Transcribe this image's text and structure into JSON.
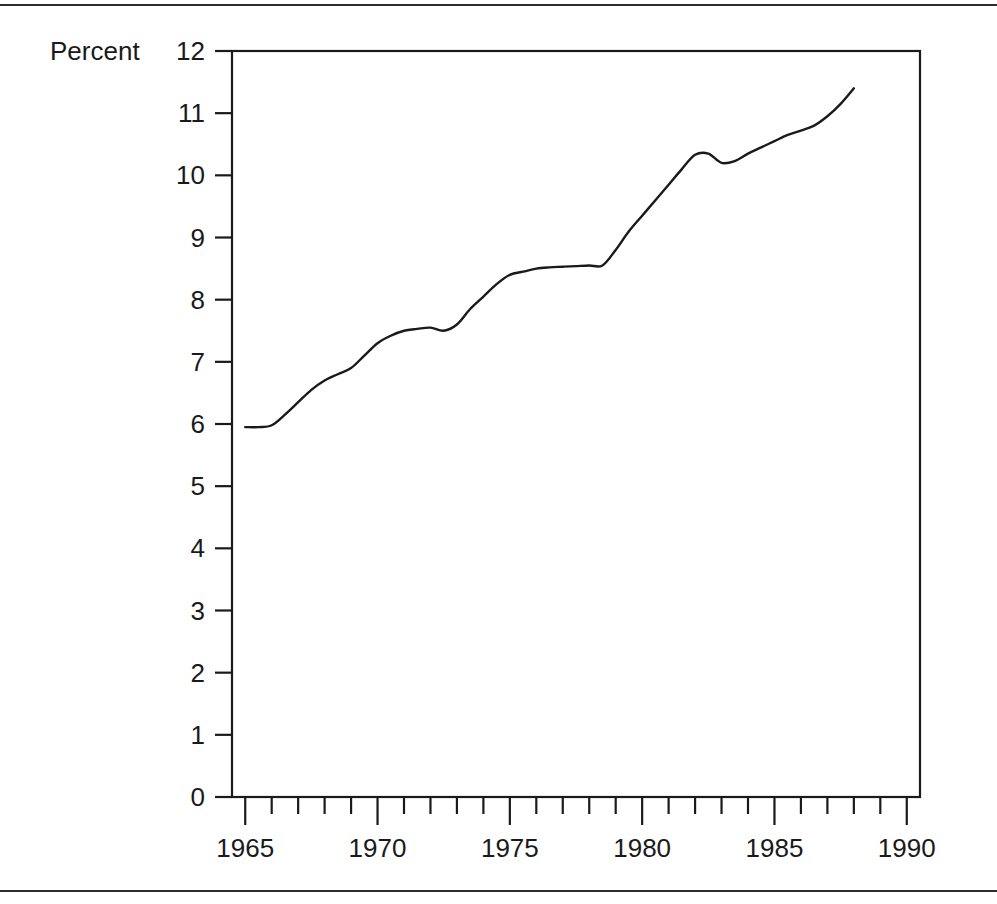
{
  "figure": {
    "ylabel": "Percent",
    "top_rule": true,
    "bottom_rule": true
  },
  "chart_data": {
    "type": "line",
    "title": "",
    "subtitle": "",
    "xlabel": "",
    "ylabel": "Percent",
    "xlim": [
      1964.5,
      1990.5
    ],
    "ylim": [
      0,
      12
    ],
    "grid": false,
    "legend": false,
    "legend_position": "none",
    "x_tick_labels": [
      "1965",
      "1970",
      "1975",
      "1980",
      "1985",
      "1990"
    ],
    "x_major_ticks": [
      1965,
      1970,
      1975,
      1980,
      1985,
      1990
    ],
    "x_minor_ticks": [
      1966,
      1967,
      1968,
      1969,
      1971,
      1972,
      1973,
      1974,
      1976,
      1977,
      1978,
      1979,
      1981,
      1982,
      1983,
      1984,
      1986,
      1987,
      1988,
      1989
    ],
    "y_tick_labels": [
      "0",
      "1",
      "2",
      "3",
      "4",
      "5",
      "6",
      "7",
      "8",
      "9",
      "10",
      "11",
      "12"
    ],
    "y_ticks": [
      0,
      1,
      2,
      3,
      4,
      5,
      6,
      7,
      8,
      9,
      10,
      11,
      12
    ],
    "line_color": "#1a1a1a",
    "series": [
      {
        "name": "Percent",
        "x": [
          1965,
          1965.5,
          1966,
          1966.5,
          1967,
          1967.5,
          1968,
          1968.5,
          1969,
          1969.5,
          1970,
          1970.5,
          1971,
          1971.5,
          1972,
          1972.5,
          1973,
          1973.5,
          1974,
          1974.5,
          1975,
          1975.5,
          1976,
          1976.5,
          1977,
          1977.5,
          1978,
          1978.5,
          1979,
          1979.5,
          1980,
          1980.5,
          1981,
          1981.5,
          1982,
          1982.5,
          1983,
          1983.5,
          1984,
          1984.5,
          1985,
          1985.5,
          1986,
          1986.5,
          1987,
          1987.5,
          1988
        ],
        "y": [
          5.95,
          5.95,
          5.98,
          6.15,
          6.35,
          6.55,
          6.7,
          6.8,
          6.9,
          7.1,
          7.3,
          7.42,
          7.5,
          7.53,
          7.55,
          7.5,
          7.6,
          7.85,
          8.05,
          8.25,
          8.4,
          8.45,
          8.5,
          8.52,
          8.53,
          8.54,
          8.55,
          8.55,
          8.8,
          9.1,
          9.35,
          9.6,
          9.85,
          10.1,
          10.33,
          10.35,
          10.2,
          10.23,
          10.35,
          10.45,
          10.55,
          10.65,
          10.72,
          10.8,
          10.95,
          11.15,
          11.4
        ]
      }
    ]
  }
}
